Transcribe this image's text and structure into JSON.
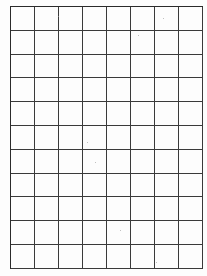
{
  "document": {
    "type": "grid-paper",
    "grid": {
      "columns": 8,
      "rows": 11,
      "cell_width_px": 24,
      "cell_height_px": 23.8,
      "left_px": 10,
      "top_px": 6,
      "line_color": "#3a3a3a",
      "background_color": "#fdfdfd"
    }
  }
}
